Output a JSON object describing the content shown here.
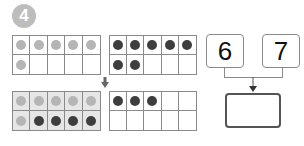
{
  "problem_number": "4",
  "frames": [
    {
      "id": "frame-top-left",
      "shaded": false,
      "cells": [
        "light",
        "light",
        "light",
        "light",
        "light",
        "light",
        "",
        "",
        "",
        ""
      ]
    },
    {
      "id": "frame-top-right",
      "shaded": false,
      "cells": [
        "dark",
        "dark",
        "dark",
        "dark",
        "dark",
        "dark",
        "dark",
        "",
        "",
        ""
      ]
    },
    {
      "id": "frame-bottom-left",
      "shaded": true,
      "cells": [
        "light",
        "light",
        "light",
        "light",
        "light",
        "light",
        "dark",
        "dark",
        "dark",
        "dark"
      ]
    },
    {
      "id": "frame-bottom-right",
      "shaded": false,
      "cells": [
        "dark",
        "dark",
        "dark",
        "",
        "",
        "",
        "",
        "",
        "",
        ""
      ]
    }
  ],
  "addends": [
    "6",
    "7"
  ],
  "answer": ""
}
